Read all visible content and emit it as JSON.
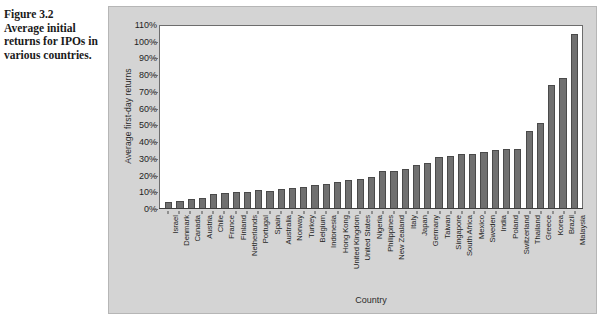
{
  "caption": {
    "figure_number": "Figure 3.2",
    "figure_text": "Average initial returns for IPOs in various countries."
  },
  "chart_data": {
    "type": "bar",
    "title": "",
    "xlabel": "Country",
    "ylabel": "Average first-day returns",
    "ylim": [
      0,
      110
    ],
    "ytick_labels": [
      "110%",
      "100%",
      "90%",
      "80%",
      "70%",
      "60%",
      "50%",
      "40%",
      "30%",
      "20%",
      "10%",
      "0%"
    ],
    "ytick_values": [
      110,
      100,
      90,
      80,
      70,
      60,
      50,
      40,
      30,
      20,
      10,
      0
    ],
    "grid": false,
    "legend": "none",
    "bar_color": "#707070",
    "plot_background": "#ffffff",
    "panel_background": "#d4d4d4",
    "categories": [
      "Israel",
      "Denmark",
      "Canada",
      "Austria",
      "Chile",
      "France",
      "Finland",
      "Netherlands",
      "Portugal",
      "Spain",
      "Australia",
      "Norway",
      "Turkey",
      "Belgium",
      "Indonesia",
      "Hong Kong",
      "United Kingdom",
      "United States",
      "Nigeria",
      "Philippines",
      "New Zealand",
      "Italy",
      "Japan",
      "Germany",
      "Taiwan",
      "Singapore",
      "South Africa",
      "Mexico",
      "Sweden",
      "India",
      "Poland",
      "Switzerland",
      "Thailand",
      "Greece",
      "Korea",
      "Brazil",
      "Malaysia"
    ],
    "values": [
      4,
      5,
      6,
      6.5,
      8.8,
      9.5,
      10.1,
      10.2,
      11.6,
      10.7,
      12.1,
      12.5,
      13.1,
      14.6,
      15.1,
      15.9,
      17.4,
      18.1,
      19.1,
      22.7,
      23.0,
      23.9,
      26.3,
      27.7,
      31.1,
      31.4,
      32.7,
      33.0,
      34.1,
      35.3,
      35.6,
      35.8,
      46.7,
      51.7,
      74.3,
      78.5,
      104.9
    ],
    "value_unit": "%"
  }
}
